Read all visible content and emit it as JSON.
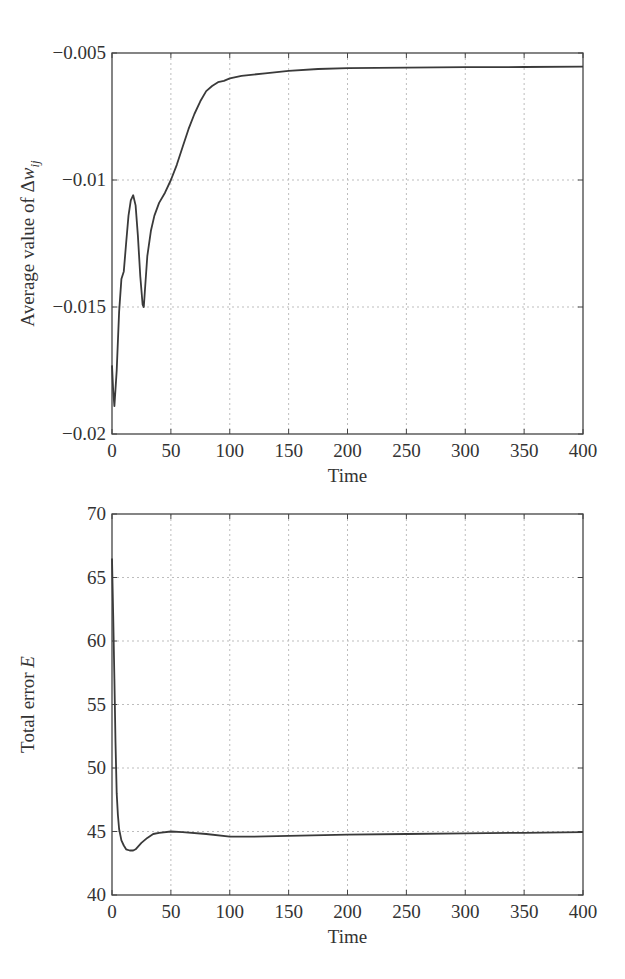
{
  "chart_data": [
    {
      "type": "line",
      "title": "",
      "xlabel": "Time",
      "ylabel": "Average value of Δw_ij",
      "ylabel_parts": {
        "main": "Average value of Δ",
        "var": "w",
        "sub": "ij"
      },
      "xlim": [
        0,
        400
      ],
      "ylim": [
        -0.02,
        -0.005
      ],
      "grid": true,
      "legend": null,
      "x_ticks": [
        0,
        50,
        100,
        150,
        200,
        250,
        300,
        350,
        400
      ],
      "x_tick_labels": [
        "0",
        "50",
        "100",
        "150",
        "200",
        "250",
        "300",
        "350",
        "400"
      ],
      "y_ticks": [
        -0.005,
        -0.01,
        -0.015,
        -0.02
      ],
      "y_tick_labels": [
        "−0.005",
        "−0.01",
        "−0.015",
        "−0.02"
      ],
      "series": [
        {
          "name": "Average Δw_ij",
          "x": [
            0,
            1,
            2,
            4,
            6,
            8,
            10,
            12,
            14,
            16,
            18,
            20,
            22,
            24,
            26,
            27,
            28,
            30,
            33,
            36,
            40,
            45,
            50,
            55,
            60,
            65,
            70,
            75,
            80,
            85,
            90,
            95,
            100,
            110,
            120,
            130,
            150,
            175,
            200,
            250,
            300,
            350,
            400
          ],
          "y": [
            -0.0173,
            -0.0183,
            -0.0189,
            -0.0175,
            -0.0152,
            -0.0139,
            -0.0136,
            -0.0125,
            -0.0114,
            -0.0108,
            -0.0106,
            -0.011,
            -0.0122,
            -0.0138,
            -0.0149,
            -0.015,
            -0.0143,
            -0.013,
            -0.012,
            -0.0114,
            -0.0109,
            -0.0105,
            -0.01,
            -0.0094,
            -0.0087,
            -0.008,
            -0.0074,
            -0.0069,
            -0.0065,
            -0.0063,
            -0.00615,
            -0.0061,
            -0.006,
            -0.0059,
            -0.00585,
            -0.0058,
            -0.0057,
            -0.00563,
            -0.0056,
            -0.00558,
            -0.00556,
            -0.00555,
            -0.00554
          ]
        }
      ]
    },
    {
      "type": "line",
      "title": "",
      "xlabel": "Time",
      "ylabel": "Total error E",
      "ylabel_parts": {
        "main": "Total error ",
        "var": "E"
      },
      "xlim": [
        0,
        400
      ],
      "ylim": [
        40,
        70
      ],
      "grid": true,
      "legend": null,
      "x_ticks": [
        0,
        50,
        100,
        150,
        200,
        250,
        300,
        350,
        400
      ],
      "x_tick_labels": [
        "0",
        "50",
        "100",
        "150",
        "200",
        "250",
        "300",
        "350",
        "400"
      ],
      "y_ticks": [
        40,
        45,
        50,
        55,
        60,
        65,
        70
      ],
      "y_tick_labels": [
        "40",
        "45",
        "50",
        "55",
        "60",
        "65",
        "70"
      ],
      "series": [
        {
          "name": "Total error E",
          "x": [
            0,
            1,
            2,
            3,
            4,
            5,
            6,
            8,
            10,
            12,
            15,
            18,
            20,
            25,
            30,
            35,
            40,
            50,
            60,
            80,
            100,
            120,
            150,
            200,
            250,
            300,
            350,
            400
          ],
          "y": [
            66.5,
            62,
            57,
            52,
            48,
            46.3,
            45.2,
            44.3,
            43.9,
            43.6,
            43.5,
            43.5,
            43.6,
            44.1,
            44.5,
            44.8,
            44.9,
            45.0,
            44.95,
            44.8,
            44.6,
            44.6,
            44.65,
            44.75,
            44.8,
            44.85,
            44.9,
            44.95
          ]
        }
      ]
    }
  ]
}
